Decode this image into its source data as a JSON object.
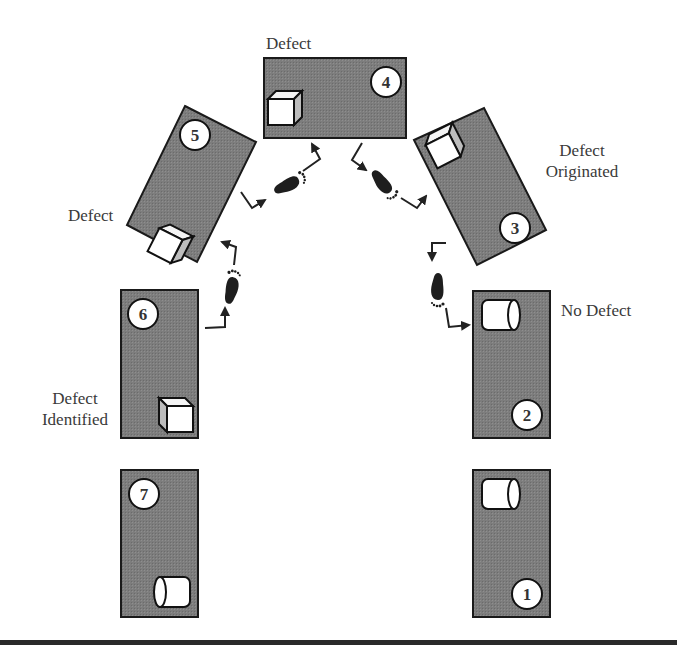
{
  "diagram": {
    "type": "process-flow",
    "colors": {
      "station_fill": "#7a7a7a",
      "station_border": "#222222",
      "part_fill": "#ffffff",
      "bottom_rule": "#2a2a2a",
      "label_text": "#3a3a3a"
    },
    "stations": [
      {
        "id": 1,
        "number": "1",
        "part": "cylinder",
        "label": ""
      },
      {
        "id": 2,
        "number": "2",
        "part": "cylinder",
        "label": "No Defect"
      },
      {
        "id": 3,
        "number": "3",
        "part": "cube",
        "label_line1": "Defect",
        "label_line2": "Originated"
      },
      {
        "id": 4,
        "number": "4",
        "part": "cube",
        "label": "Defect"
      },
      {
        "id": 5,
        "number": "5",
        "part": "cube",
        "label": "Defect"
      },
      {
        "id": 6,
        "number": "6",
        "part": "cube",
        "label_line1": "Defect",
        "label_line2": "Identified"
      },
      {
        "id": 7,
        "number": "7",
        "part": "cylinder",
        "label": ""
      }
    ],
    "walk_paths": [
      {
        "from": 2,
        "to": 3,
        "icon": "footprint-icon"
      },
      {
        "from": 3,
        "to": 4,
        "icon": "footprint-icon"
      },
      {
        "from": 4,
        "to": 5,
        "icon": "footprint-icon"
      },
      {
        "from": 5,
        "to": 6,
        "icon": "footprint-icon"
      }
    ]
  }
}
